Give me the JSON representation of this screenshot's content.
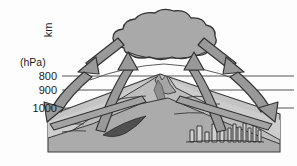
{
  "figure": {
    "background_color": "#fdfdfd"
  },
  "axis": {
    "vertical_label": "km",
    "pressure_unit_label": "(hPa)",
    "pressure_levels": [
      {
        "label": "800",
        "y": 76
      },
      {
        "label": "900",
        "y": 90
      },
      {
        "label": "1000",
        "y": 108
      }
    ]
  },
  "colors": {
    "line": "#3a3a3a",
    "arrow_fill": "#9a9a9a",
    "arrow_stroke": "#3a3a3a",
    "cloud_fill": "#a8a8a8",
    "cloud_stroke": "#3a3a3a",
    "ground_light": "#c9c9c9",
    "ground_mid": "#b0b0b0",
    "ground_dark": "#8e8e8e",
    "shadow_dark": "#4a4a4a",
    "text": "#1a1a1a"
  },
  "elements": {
    "cloud_name": "cumulus-cloud",
    "mountain_name": "mountain-volcano",
    "city_name": "city-buildings",
    "base_block_name": "ground-base-block",
    "shadow_name": "valley-shadow"
  },
  "flow_arrows": [
    {
      "name": "upslope-arrow-left",
      "description": "curved ascending flow on left slope into cloud"
    },
    {
      "name": "upslope-arrow-right",
      "description": "curved ascending flow on right slope into cloud"
    },
    {
      "name": "outflow-arrow-left",
      "description": "straight outflow from cloud toward lower left"
    },
    {
      "name": "outflow-arrow-right",
      "description": "straight outflow from cloud toward lower right"
    },
    {
      "name": "subsidence-arrow-left",
      "description": "curved descending flow on far left"
    },
    {
      "name": "subsidence-arrow-right",
      "description": "curved descending flow on far right"
    }
  ]
}
